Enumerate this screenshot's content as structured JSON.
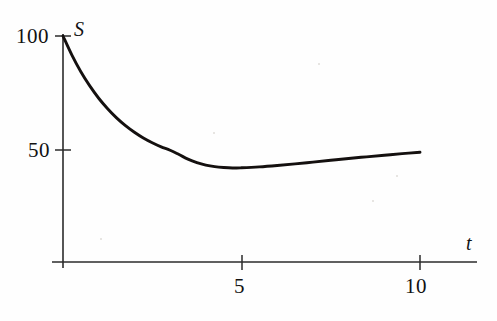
{
  "chart_data": {
    "type": "line",
    "title": "",
    "subtitle": "",
    "xlabel": "t",
    "ylabel": "S",
    "xlim": [
      0,
      11.6
    ],
    "ylim": [
      0,
      108
    ],
    "grid": false,
    "legend": null,
    "xticks": [
      5,
      10
    ],
    "xticklabels": [
      "5",
      "10"
    ],
    "yticks": [
      50,
      100
    ],
    "yticklabels": [
      "50",
      "100"
    ],
    "annotations": [],
    "series": [
      {
        "name": "S(t)",
        "color": "#14100f",
        "x": [
          0.0,
          0.25,
          0.5,
          0.75,
          1.0,
          1.25,
          1.5,
          1.75,
          2.0,
          2.25,
          2.5,
          2.75,
          3.0,
          3.25,
          3.5,
          3.75,
          4.0,
          4.25,
          4.5,
          4.75,
          5.0,
          5.5,
          6.0,
          6.5,
          7.0,
          7.5,
          8.0,
          8.5,
          9.0,
          9.5,
          10.0
        ],
        "y": [
          100.0,
          91.6,
          84.3,
          78.1,
          72.7,
          68.1,
          64.1,
          60.7,
          57.8,
          55.3,
          53.2,
          51.4,
          49.9,
          48.0,
          46.0,
          44.5,
          43.4,
          42.7,
          42.3,
          42.1,
          42.2,
          42.6,
          43.2,
          43.9,
          44.7,
          45.5,
          46.3,
          47.0,
          47.7,
          48.4,
          49.0
        ]
      }
    ],
    "minimum": {
      "t": 4.75,
      "S": 42.1
    },
    "start_point": {
      "t": 0,
      "S": 100
    },
    "end_point": {
      "t": 10,
      "S": 49
    }
  },
  "geometry": {
    "x_of_t0": 63,
    "x_of_t5": 242,
    "x_of_t10": 420,
    "y_of_S100": 36,
    "y_of_S50": 150,
    "axis_y": 262,
    "y_axis_top": 34,
    "x_axis_left": 52,
    "x_axis_right": 477
  },
  "style": {
    "curve_color": "#14100f",
    "axis_color": "#2b2b2b",
    "text_color": "#121212",
    "background": "#fefefe"
  }
}
